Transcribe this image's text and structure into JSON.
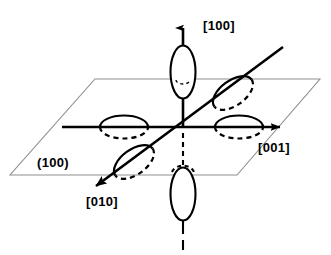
{
  "figure": {
    "type": "diagram",
    "width": 331,
    "height": 255,
    "background_color": "#ffffff",
    "stroke_color": "#000000",
    "plane_edge_color": "#8a8a8a"
  },
  "labels": {
    "axis_100": "[100]",
    "axis_001": "[001]",
    "axis_010": "[010]",
    "plane_100": "(100)"
  },
  "geometry": {
    "origin": {
      "x": 183,
      "y": 127
    },
    "plane_parallelogram": {
      "points": "95,79 320,79 237,175 10,175",
      "note": "the (100) plane drawn in perspective"
    },
    "axes": [
      {
        "name": "axis-100-vertical",
        "label": "[100]",
        "from": {
          "x": 183,
          "y": 127
        },
        "to": {
          "x": 183,
          "y": 22
        },
        "arrow": true,
        "style": "solid",
        "direction": "up"
      },
      {
        "name": "axis-100-vertical-negative",
        "label": "",
        "from": {
          "x": 183,
          "y": 127
        },
        "to": {
          "x": 183,
          "y": 247
        },
        "arrow": false,
        "style": "dashed-below-plane",
        "direction": "down"
      },
      {
        "name": "axis-001-horizontal",
        "label": "[001]",
        "from": {
          "x": 62,
          "y": 127
        },
        "to": {
          "x": 284,
          "y": 127
        },
        "arrow": true,
        "style": "solid",
        "direction": "right"
      },
      {
        "name": "axis-010-diagonal",
        "label": "[010]",
        "from": {
          "x": 283,
          "y": 47
        },
        "to": {
          "x": 88,
          "y": 192
        },
        "arrow": true,
        "style": "solid",
        "direction": "down-left"
      }
    ],
    "lobes": [
      {
        "name": "lobe-top",
        "cx": 183,
        "cy": 72,
        "rx": 12,
        "ry": 26,
        "rotation": 0,
        "orientation": "vertical"
      },
      {
        "name": "lobe-bottom",
        "cx": 183,
        "cy": 194,
        "rx": 12,
        "ry": 26,
        "rotation": 0,
        "orientation": "vertical"
      },
      {
        "name": "lobe-left",
        "cx": 124,
        "cy": 127,
        "rx": 24,
        "ry": 11,
        "rotation": 0,
        "orientation": "horizontal"
      },
      {
        "name": "lobe-right",
        "cx": 239,
        "cy": 127,
        "rx": 24,
        "ry": 11,
        "rotation": 0,
        "orientation": "horizontal"
      },
      {
        "name": "lobe-diagonal-upper-right",
        "cx": 233,
        "cy": 93,
        "rx": 12,
        "ry": 23,
        "rotation": 54,
        "orientation": "diagonal"
      },
      {
        "name": "lobe-diagonal-lower-left",
        "cx": 134,
        "cy": 162,
        "rx": 12,
        "ry": 23,
        "rotation": 54,
        "orientation": "diagonal"
      }
    ]
  }
}
